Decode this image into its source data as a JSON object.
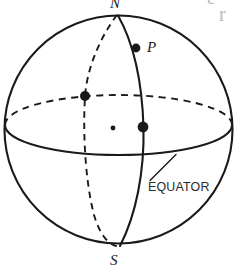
{
  "figure": {
    "kind": "sphere-diagram",
    "background_color": "#ffffff",
    "ink_color": "#1a1a1a",
    "labels": {
      "north_pole": "N",
      "south_pole": "S",
      "point": "P",
      "equator": "EQUATOR"
    },
    "bleed_text": {
      "fragment_1": "e",
      "fragment_2": "r"
    },
    "geometry": {
      "outline_circle": {
        "cx": 118.5,
        "cy": 129.5,
        "r": 114
      },
      "equator_ellipse": {
        "cx": 118.5,
        "cy": 125,
        "rx": 113.5,
        "ry": 30
      },
      "meridian_front": {
        "label": "solid meridian through P"
      },
      "meridian_back": {
        "label": "dashed meridian"
      }
    },
    "markers": [
      {
        "name": "point-p-dot",
        "x": 136,
        "y": 48,
        "r": 4.4,
        "style": "filled"
      },
      {
        "name": "dashed-meridian-equator-dot",
        "x": 85,
        "y": 96,
        "r": 5.0,
        "style": "filled"
      },
      {
        "name": "sphere-center-dot",
        "x": 113,
        "y": 128,
        "r": 2.4,
        "style": "filled"
      },
      {
        "name": "front-meridian-equator-dot",
        "x": 143,
        "y": 127,
        "r": 5.4,
        "style": "filled"
      }
    ]
  }
}
